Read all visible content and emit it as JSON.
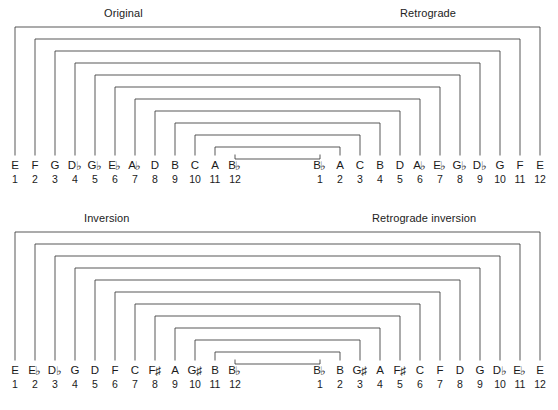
{
  "figure": {
    "type": "twelve-tone-row-diagram",
    "line_color": "#3a3a3a",
    "text_color": "#1a1a1a",
    "background_color": "#ffffff"
  },
  "panels": [
    {
      "id": "original",
      "title_left": "Original",
      "title_right": "Retrograde",
      "left_row": {
        "notes": [
          "E",
          "F",
          "G",
          "D♭",
          "G♭",
          "E♭",
          "A♭",
          "D",
          "B",
          "C",
          "A",
          "B♭"
        ],
        "indices": [
          "1",
          "2",
          "3",
          "4",
          "5",
          "6",
          "7",
          "8",
          "9",
          "10",
          "11",
          "12"
        ]
      },
      "right_row": {
        "notes": [
          "B♭",
          "A",
          "C",
          "B",
          "D",
          "A♭",
          "E♭",
          "G♭",
          "D♭",
          "G",
          "F",
          "E"
        ],
        "indices": [
          "1",
          "2",
          "3",
          "4",
          "5",
          "6",
          "7",
          "8",
          "9",
          "10",
          "11",
          "12"
        ]
      }
    },
    {
      "id": "inversion",
      "title_left": "Inversion",
      "title_right": "Retrograde inversion",
      "left_row": {
        "notes": [
          "E",
          "E♭",
          "D♭",
          "G",
          "D",
          "F",
          "C",
          "F♯",
          "A",
          "G♯",
          "B",
          "B♭"
        ],
        "indices": [
          "1",
          "2",
          "3",
          "4",
          "5",
          "6",
          "7",
          "8",
          "9",
          "10",
          "11",
          "12"
        ]
      },
      "right_row": {
        "notes": [
          "B♭",
          "B",
          "G♯",
          "A",
          "F♯",
          "C",
          "F",
          "D",
          "G",
          "D♭",
          "E♭",
          "E"
        ],
        "indices": [
          "1",
          "2",
          "3",
          "4",
          "5",
          "6",
          "7",
          "8",
          "9",
          "10",
          "11",
          "12"
        ]
      }
    }
  ],
  "geometry": {
    "left_first_x": 15,
    "left_step": 20,
    "right_last_x": 540,
    "right_step": 20,
    "bracket_top_start": 27,
    "bracket_step": 12,
    "bracket_bottom": 155,
    "panel_offsets": [
      0,
      213
    ]
  }
}
